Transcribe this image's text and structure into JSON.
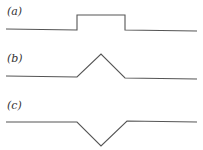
{
  "panels": [
    {
      "id": "a",
      "label": "(a)",
      "shape": "rectangular-pulse",
      "points": [
        [
          6,
          29
        ],
        [
          77,
          30
        ],
        [
          77,
          15
        ],
        [
          125,
          15
        ],
        [
          125,
          30
        ],
        [
          197,
          31
        ]
      ]
    },
    {
      "id": "b",
      "label": "(b)",
      "shape": "triangular-peak-up",
      "points": [
        [
          6,
          76
        ],
        [
          77,
          77
        ],
        [
          101,
          54
        ],
        [
          125,
          78
        ],
        [
          197,
          79
        ]
      ]
    },
    {
      "id": "c",
      "label": "(c)",
      "shape": "triangular-dip-down",
      "points": [
        [
          6,
          122
        ],
        [
          77,
          122
        ],
        [
          101,
          146
        ],
        [
          127,
          121
        ],
        [
          197,
          122
        ]
      ]
    }
  ],
  "colors": {
    "line": "#555555",
    "label": "#333333",
    "background": "#ffffff"
  }
}
